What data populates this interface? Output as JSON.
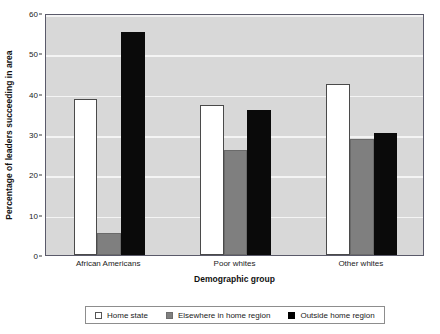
{
  "chart_data": {
    "type": "bar",
    "title": "",
    "subtitle": "",
    "xlabel": "Demographic group",
    "ylabel": "Percentage of leaders succeeding in area",
    "categories": [
      "African Americans",
      "Poor whites",
      "Other whites"
    ],
    "series": [
      {
        "name": "Home state",
        "color": "#ffffff",
        "values": [
          38.6,
          37.2,
          42.5
        ]
      },
      {
        "name": "Elsewhere in home region",
        "color": "#7f7f7f",
        "values": [
          5.4,
          26.0,
          28.7
        ]
      },
      {
        "name": "Outside home region",
        "color": "#000000",
        "values": [
          55.3,
          35.9,
          30.2
        ]
      }
    ],
    "ylim": [
      0,
      60
    ],
    "yticks": [
      0,
      10,
      20,
      30,
      40,
      50,
      60
    ],
    "ytick_labels": [
      "0",
      "10",
      "20",
      "30",
      "40",
      "50",
      "60"
    ],
    "grid": true,
    "grid_axis": "y",
    "grid_color": "#f4f4f4",
    "plot_background": "#d8d8d8",
    "legend_position": "below-center",
    "legend_entries": [
      {
        "label": "Home state",
        "swatch": "sw-white"
      },
      {
        "label": "Elsewhere in home region",
        "swatch": "sw-gray"
      },
      {
        "label": "Outside home region",
        "swatch": "sw-black"
      }
    ]
  }
}
